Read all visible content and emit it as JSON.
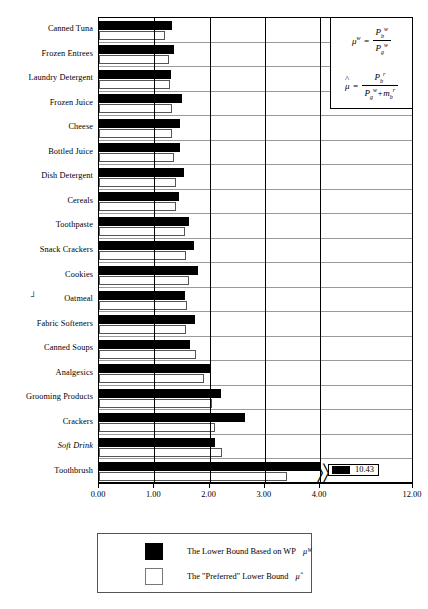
{
  "chart_data": {
    "type": "bar",
    "orientation": "horizontal",
    "title": "",
    "xlabel": "",
    "ylabel": "",
    "xlim": [
      0.0,
      4.0
    ],
    "grid": true,
    "axis_break": {
      "after": 4.0,
      "resumes_at": 12.0,
      "marker": "〉〉"
    },
    "xticks": [
      "0.00",
      "1.00",
      "2.00",
      "3.00",
      "4.00",
      "12.00"
    ],
    "xtick_values": [
      0.0,
      1.0,
      2.0,
      3.0,
      4.0,
      12.0
    ],
    "categories": [
      "Canned Tuna",
      "Frozen Entrees",
      "Laundry Detergent",
      "Frozen Juice",
      "Cheese",
      "Bottled Juice",
      "Dish Detergent",
      "Cereals",
      "Toothpaste",
      "Snack Crackers",
      "Cookies",
      "Oatmeal",
      "Fabric Softeners",
      "Canned Soups",
      "Analgesics",
      "Grooming Products",
      "Crackers",
      "Soft Drink",
      "Toothbrush"
    ],
    "series": [
      {
        "name": "The Lower Bound Based on WP",
        "symbol": "μᵂ",
        "color": "#000000",
        "values": [
          1.32,
          1.36,
          1.3,
          1.5,
          1.46,
          1.46,
          1.53,
          1.45,
          1.63,
          1.72,
          1.8,
          1.55,
          1.73,
          1.65,
          2.03,
          2.21,
          2.64,
          2.1,
          10.43
        ]
      },
      {
        "name": "The \"Preferred\" Lower Bound",
        "symbol": "μ̂",
        "color": "#ffffff",
        "values": [
          1.19,
          1.27,
          1.28,
          1.33,
          1.33,
          1.35,
          1.4,
          1.4,
          1.55,
          1.57,
          1.62,
          1.6,
          1.58,
          1.75,
          1.9,
          2.05,
          2.1,
          2.22,
          3.4
        ]
      }
    ],
    "value_callout": {
      "label": "10.43",
      "series": "The Lower Bound Based on WP",
      "category": "Toothbrush"
    }
  },
  "formulas": {
    "mu_w": {
      "lhs": "μ",
      "lhs_sup": "w",
      "equals": "=",
      "numerator": {
        "base": "P",
        "sub": "b",
        "sup": "w"
      },
      "denominator": {
        "base": "P",
        "sub": "g",
        "sup": "w"
      }
    },
    "mu_hat": {
      "lhs": "μ",
      "hat": "^",
      "equals": "=",
      "numerator": {
        "base": "P",
        "sub": "b",
        "sup": "r"
      },
      "denominator_first": {
        "base": "P",
        "sub": "g",
        "sup": "w"
      },
      "denominator_op": "+",
      "denominator_second": {
        "base": "m",
        "sub": "b",
        "sup": "r"
      }
    }
  },
  "legend": {
    "items": [
      {
        "swatch": "black",
        "text": "The Lower Bound Based on WP",
        "symbol": "μᵂ"
      },
      {
        "swatch": "white",
        "text": "The \"Preferred\" Lower Bound",
        "symbol": "μ̂"
      }
    ]
  },
  "annotations": {
    "oatmeal_mark": "┘"
  }
}
